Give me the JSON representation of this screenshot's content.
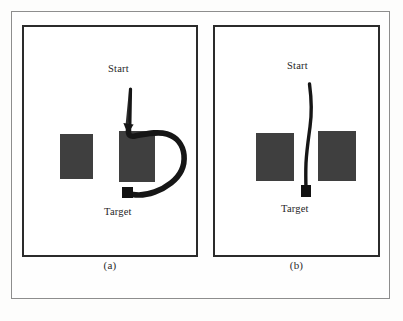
{
  "figure": {
    "kind": "two-panel path planning diagram",
    "background_color": "#fdfdfc",
    "outer_frame_color": "#8d8d8d",
    "panel_border_color": "#2b2b2b",
    "obstacle_color": "#3f3f3f",
    "path_color": "#161616"
  },
  "panels": [
    {
      "id": "a",
      "caption": "(a)",
      "start_label": "Start",
      "target_label": "Target",
      "path_description": "long detour curving clockwise around the right obstacle",
      "obstacles": [
        {
          "name": "left-obstacle",
          "x": 36,
          "y": 107,
          "w": 33,
          "h": 45
        },
        {
          "name": "right-obstacle",
          "x": 95,
          "y": 104,
          "w": 36,
          "h": 51
        }
      ],
      "start_point": {
        "x": 106,
        "y": 58
      },
      "target_point": {
        "x": 105,
        "y": 165
      }
    },
    {
      "id": "b",
      "caption": "(b)",
      "start_label": "Start",
      "target_label": "Target",
      "path_description": "short nearly straight path through the gap between the two obstacles",
      "obstacles": [
        {
          "name": "left-obstacle",
          "x": 41,
          "y": 106,
          "w": 38,
          "h": 48
        },
        {
          "name": "right-obstacle",
          "x": 103,
          "y": 104,
          "w": 38,
          "h": 50
        }
      ],
      "start_point": {
        "x": 93,
        "y": 54
      },
      "target_point": {
        "x": 91,
        "y": 163
      }
    }
  ]
}
